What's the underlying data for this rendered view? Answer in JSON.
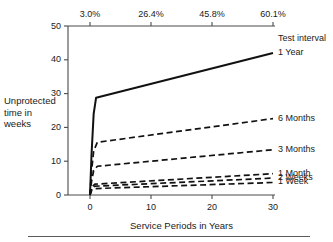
{
  "chart_data": {
    "type": "line",
    "title": "",
    "xlabel": "Service Periods in Years",
    "ylabel": "Unprotected time in weeks",
    "ylabel_lines": [
      "Unprotected",
      "time in",
      "weeks"
    ],
    "xlim": [
      0,
      30
    ],
    "ylim": [
      0,
      50
    ],
    "grid": false,
    "legend_position": "right-of-plot",
    "legend_title": "Test interval",
    "x_ticks": [
      0,
      10,
      20,
      30
    ],
    "x_tick_labels": [
      "0",
      "10",
      "20",
      "30"
    ],
    "y_ticks": [
      0,
      10,
      20,
      30,
      40,
      50
    ],
    "y_tick_labels": [
      "0",
      "10",
      "20",
      "30",
      "40",
      "50"
    ],
    "secondary_xaxis": {
      "label": "",
      "ticks": [
        0,
        10,
        20,
        30
      ],
      "tick_labels": [
        "3.0%",
        "26.4%",
        "45.8%",
        "60.1%"
      ]
    },
    "series": [
      {
        "name": "1 Year",
        "style": "solid",
        "points": [
          [
            0,
            0
          ],
          [
            0.25,
            12
          ],
          [
            0.6,
            24
          ],
          [
            1.0,
            28.8
          ],
          [
            30,
            42.0
          ]
        ]
      },
      {
        "name": "6 Months",
        "style": "dashed",
        "points": [
          [
            0,
            0
          ],
          [
            0.25,
            7
          ],
          [
            0.6,
            13
          ],
          [
            1.2,
            15.6
          ],
          [
            30,
            22.6
          ]
        ]
      },
      {
        "name": "3 Months",
        "style": "dashed",
        "points": [
          [
            0,
            0
          ],
          [
            0.25,
            4
          ],
          [
            0.6,
            7.2
          ],
          [
            1.2,
            8.5
          ],
          [
            30,
            13.4
          ]
        ]
      },
      {
        "name": "1 Month",
        "style": "dashed",
        "points": [
          [
            0,
            0
          ],
          [
            0.3,
            2.4
          ],
          [
            0.8,
            3.2
          ],
          [
            30,
            6.3
          ]
        ]
      },
      {
        "name": "2 Weeks",
        "style": "dashed",
        "points": [
          [
            0,
            0
          ],
          [
            0.3,
            2.0
          ],
          [
            0.8,
            2.6
          ],
          [
            30,
            5.0
          ]
        ]
      },
      {
        "name": "1 Week",
        "style": "dashed",
        "points": [
          [
            0,
            0
          ],
          [
            0.3,
            1.5
          ],
          [
            0.8,
            1.9
          ],
          [
            30,
            3.7
          ]
        ]
      }
    ]
  },
  "colors": {
    "line": "#111111",
    "axis": "#4a4a4a",
    "text": "#1a1a1a",
    "rule": "#5a5a5a"
  }
}
